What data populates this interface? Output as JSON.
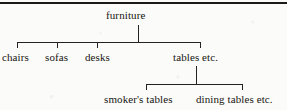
{
  "figure": {
    "kind": "tree-diagram",
    "top_rule": true,
    "root": {
      "label": "furniture"
    },
    "level1": [
      {
        "label": "chairs"
      },
      {
        "label": "sofas"
      },
      {
        "label": "desks"
      },
      {
        "label": "tables etc."
      }
    ],
    "level2_parent": "tables etc.",
    "level2": [
      {
        "label": "smoker's tables"
      },
      {
        "label": "dining tables etc."
      }
    ],
    "colors": {
      "ink": "#17140f",
      "rule": "#1d1a16",
      "line": "#26221d",
      "paper": "#fbfbfa"
    }
  }
}
